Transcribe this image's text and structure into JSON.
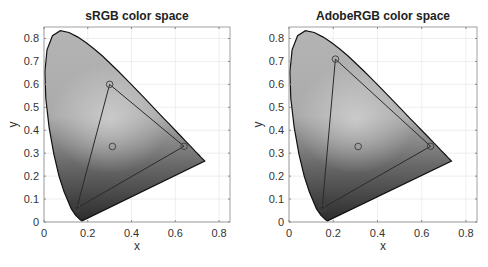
{
  "chart_data": [
    {
      "type": "scatter",
      "title": "sRGB color space",
      "xlabel": "x",
      "ylabel": "y",
      "xlim": [
        0,
        0.85
      ],
      "ylim": [
        0,
        0.85
      ],
      "xticks": [
        "0",
        "0.2",
        "0.4",
        "0.6",
        "0.8"
      ],
      "yticks": [
        "0",
        "0.1",
        "0.2",
        "0.3",
        "0.4",
        "0.5",
        "0.6",
        "0.7",
        "0.8"
      ],
      "grid": true,
      "gamut_triangle": [
        {
          "name": "R",
          "x": 0.64,
          "y": 0.33
        },
        {
          "name": "G",
          "x": 0.3,
          "y": 0.6
        },
        {
          "name": "B",
          "x": 0.15,
          "y": 0.06
        }
      ],
      "white_point": {
        "x": 0.3127,
        "y": 0.329
      },
      "background": "CIE 1931 chromaticity diagram (grayscale)"
    },
    {
      "type": "scatter",
      "title": "AdobeRGB color space",
      "xlabel": "x",
      "ylabel": "y",
      "xlim": [
        0,
        0.85
      ],
      "ylim": [
        0,
        0.85
      ],
      "xticks": [
        "0",
        "0.2",
        "0.4",
        "0.6",
        "0.8"
      ],
      "yticks": [
        "0",
        "0.1",
        "0.2",
        "0.3",
        "0.4",
        "0.5",
        "0.6",
        "0.7",
        "0.8"
      ],
      "grid": true,
      "gamut_triangle": [
        {
          "name": "R",
          "x": 0.64,
          "y": 0.33
        },
        {
          "name": "G",
          "x": 0.21,
          "y": 0.71
        },
        {
          "name": "B",
          "x": 0.15,
          "y": 0.06
        }
      ],
      "white_point": {
        "x": 0.3127,
        "y": 0.329
      },
      "background": "CIE 1931 chromaticity diagram (grayscale)"
    }
  ],
  "locus": [
    [
      0.1741,
      0.005
    ],
    [
      0.1738,
      0.0049
    ],
    [
      0.1733,
      0.0048
    ],
    [
      0.1726,
      0.0048
    ],
    [
      0.1714,
      0.0051
    ],
    [
      0.1689,
      0.0069
    ],
    [
      0.1644,
      0.0109
    ],
    [
      0.1566,
      0.0177
    ],
    [
      0.144,
      0.0297
    ],
    [
      0.1241,
      0.0578
    ],
    [
      0.0913,
      0.1327
    ],
    [
      0.0687,
      0.2007
    ],
    [
      0.0454,
      0.295
    ],
    [
      0.0235,
      0.4127
    ],
    [
      0.0082,
      0.5384
    ],
    [
      0.0039,
      0.6548
    ],
    [
      0.0139,
      0.7502
    ],
    [
      0.0389,
      0.812
    ],
    [
      0.0743,
      0.8338
    ],
    [
      0.1142,
      0.8262
    ],
    [
      0.1547,
      0.8059
    ],
    [
      0.1929,
      0.7816
    ],
    [
      0.2296,
      0.7543
    ],
    [
      0.2658,
      0.7243
    ],
    [
      0.3016,
      0.6923
    ],
    [
      0.3373,
      0.6589
    ],
    [
      0.3731,
      0.6245
    ],
    [
      0.4087,
      0.5896
    ],
    [
      0.4441,
      0.5547
    ],
    [
      0.4788,
      0.5202
    ],
    [
      0.5125,
      0.4866
    ],
    [
      0.5448,
      0.4544
    ],
    [
      0.5752,
      0.4242
    ],
    [
      0.6029,
      0.3965
    ],
    [
      0.627,
      0.3725
    ],
    [
      0.6482,
      0.3514
    ],
    [
      0.6658,
      0.334
    ],
    [
      0.6801,
      0.3197
    ],
    [
      0.6915,
      0.3083
    ],
    [
      0.7006,
      0.2993
    ],
    [
      0.7079,
      0.292
    ],
    [
      0.714,
      0.2859
    ],
    [
      0.719,
      0.2809
    ],
    [
      0.723,
      0.277
    ],
    [
      0.726,
      0.274
    ],
    [
      0.7347,
      0.2653
    ]
  ],
  "style": {
    "line_color": "#2a2a2a",
    "marker_color": "#444444",
    "grid_color": "#e6e6e6",
    "axis_color": "#8a8a8a"
  }
}
